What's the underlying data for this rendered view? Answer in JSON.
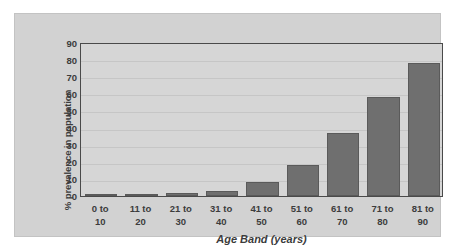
{
  "chart_data": {
    "type": "bar",
    "title": "",
    "xlabel": "Age Band (years)",
    "ylabel": "% prevalence in population",
    "categories": [
      "0 to 10",
      "11 to 20",
      "21 to 30",
      "31 to 40",
      "41 to 50",
      "51 to 60",
      "61 to 70",
      "71 to 80",
      "81 to 90"
    ],
    "category_lines": [
      [
        "0  to",
        "10"
      ],
      [
        "11 to",
        "20"
      ],
      [
        "21 to",
        "30"
      ],
      [
        "31 to",
        "40"
      ],
      [
        "41 to",
        "50"
      ],
      [
        "51 to",
        "60"
      ],
      [
        "61 to",
        "70"
      ],
      [
        "71 to",
        "80"
      ],
      [
        "81 to",
        "90"
      ]
    ],
    "values": [
      0.5,
      1,
      2,
      3,
      8,
      18,
      37,
      58,
      78
    ],
    "ylim": [
      0,
      90
    ],
    "yticks": [
      0,
      10,
      20,
      30,
      40,
      50,
      60,
      70,
      80,
      90
    ],
    "ytick_labels": [
      "0",
      "10",
      "20",
      "30",
      "40",
      "50",
      "60",
      "70",
      "80",
      "90"
    ],
    "grid": true,
    "legend": "none",
    "colors": {
      "bar_fill": "#6f6f6f",
      "bar_edge": "#5a5a5a",
      "plot_background": "#d6d6d6",
      "panel_background": "#d2d2d2",
      "gridline": "#c6c6c6",
      "axis_line": "#4a4a4a",
      "text": "#3c3c3c"
    }
  }
}
